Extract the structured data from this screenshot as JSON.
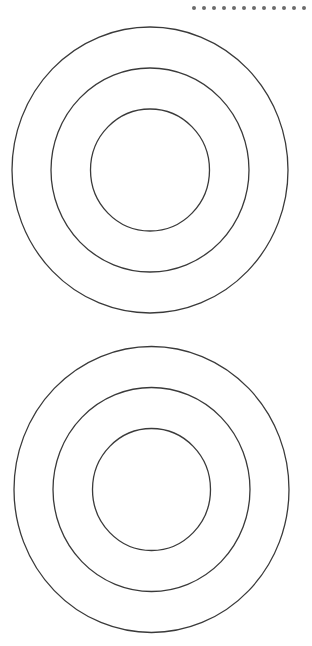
{
  "diagram": {
    "type": "concentric-circles",
    "stroke_color": "#3a3a3a",
    "stroke_width": 1.3,
    "background": "#ffffff",
    "targets": [
      {
        "name": "top-target",
        "cx": 150,
        "cy": 170,
        "rings": [
          {
            "name": "outer-ring",
            "rx": 138,
            "ry": 143
          },
          {
            "name": "middle-ring",
            "rx": 99,
            "ry": 102
          },
          {
            "name": "inner-ring",
            "rx": 59.5,
            "ry": 61
          }
        ]
      },
      {
        "name": "bottom-target",
        "cx": 151.5,
        "cy": 489.5,
        "rings": [
          {
            "name": "outer-ring",
            "rx": 137.5,
            "ry": 143
          },
          {
            "name": "middle-ring",
            "rx": 98.5,
            "ry": 102
          },
          {
            "name": "inner-ring",
            "rx": 59,
            "ry": 61
          }
        ]
      }
    ],
    "dot_row": {
      "count": 12,
      "color": "#6b6b6b"
    }
  }
}
